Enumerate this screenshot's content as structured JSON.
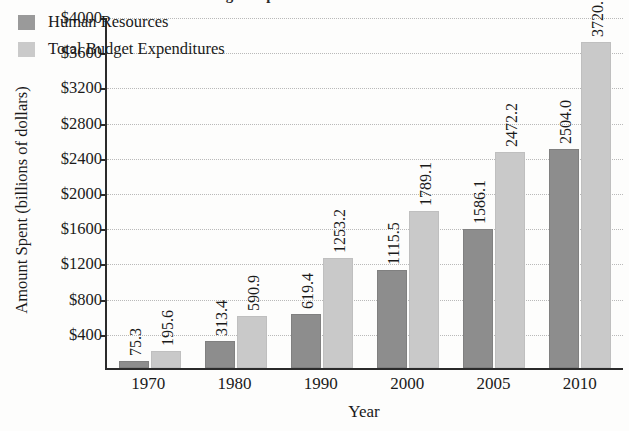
{
  "chart_data": {
    "type": "bar",
    "title": "Federal Budget Expenditures and Human Resources",
    "xlabel": "Year",
    "ylabel": "Amount Spent (billions of dollars)",
    "categories": [
      "1970",
      "1980",
      "1990",
      "2000",
      "2005",
      "2010"
    ],
    "series": [
      {
        "name": "Human Resources",
        "color": "#8d8d8d",
        "values": [
          75.3,
          313.4,
          619.4,
          1115.5,
          1586.1,
          2504.0
        ],
        "labels": [
          "75.3",
          "313.4",
          "619.4",
          "1115.5",
          "1586.1",
          "2504.0"
        ]
      },
      {
        "name": "Total Budget Expenditures",
        "color": "#c9c9c9",
        "values": [
          195.6,
          590.9,
          1253.2,
          1789.1,
          2472.2,
          3720.7
        ],
        "labels": [
          "195.6",
          "590.9",
          "1253.2",
          "1789.1",
          "2472.2",
          "3720.7"
        ]
      }
    ],
    "ylim": [
      0,
      4000
    ],
    "ytick_values": [
      400,
      800,
      1200,
      1600,
      2000,
      2400,
      2800,
      3200,
      3600,
      4000
    ],
    "ytick_labels": [
      "$400",
      "$800",
      "$1200",
      "$1600",
      "$2000",
      "$2400",
      "$2800",
      "$3200",
      "$3600",
      "$4000"
    ],
    "grid": true,
    "legend_position": "upper left"
  }
}
